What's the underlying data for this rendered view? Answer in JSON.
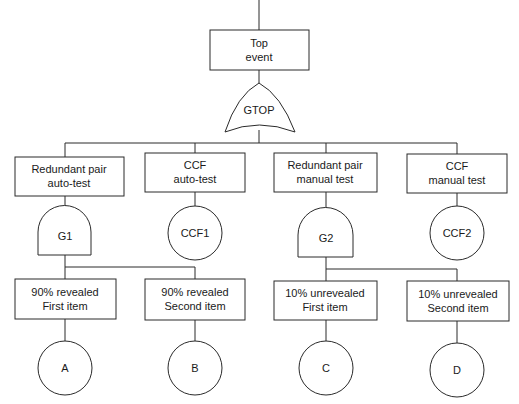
{
  "diagram": {
    "type": "fault-tree",
    "top_event": {
      "line1": "Top",
      "line2": "event"
    },
    "top_gate": {
      "label": "GTOP",
      "kind": "or-gate"
    },
    "branches": [
      {
        "line1": "Redundant pair",
        "line2": "auto-test",
        "node": {
          "label": "G1",
          "kind": "and-gate"
        }
      },
      {
        "line1": "CCF",
        "line2": "auto-test",
        "node": {
          "label": "CCF1",
          "kind": "basic-event"
        }
      },
      {
        "line1": "Redundant pair",
        "line2": "manual test",
        "node": {
          "label": "G2",
          "kind": "and-gate"
        }
      },
      {
        "line1": "CCF",
        "line2": "manual test",
        "node": {
          "label": "CCF2",
          "kind": "basic-event"
        }
      }
    ],
    "leaves": [
      {
        "line1": "90% revealed",
        "line2": "First item",
        "event": "A"
      },
      {
        "line1": "90% revealed",
        "line2": "Second item",
        "event": "B"
      },
      {
        "line1": "10% unrevealed",
        "line2": "First item",
        "event": "C"
      },
      {
        "line1": "10% unrevealed",
        "line2": "Second item",
        "event": "D"
      }
    ]
  }
}
